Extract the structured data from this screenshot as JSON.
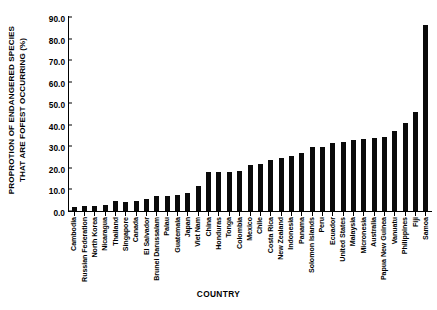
{
  "chart_data": {
    "type": "bar",
    "title": "",
    "xlabel": "COUNTRY",
    "ylabel": "PROPROTION OF ENDANGERED SPECIES THAT ARE FOFEST OCCURRING (%)",
    "ylabel_line1": "PROPROTION OF ENDANGERED SPECIES",
    "ylabel_line2": "THAT ARE FOFEST OCCURRING (%)",
    "ylim": [
      0.0,
      90.0
    ],
    "ytick_step": 10.0,
    "yticks": [
      "90.0",
      "80.0",
      "70.0",
      "60.0",
      "50.0",
      "40.0",
      "30.0",
      "20.0",
      "10.0",
      "0.0"
    ],
    "grid": false,
    "legend": null,
    "bar_color": "#0a0a0a",
    "categories": [
      "Cambodia",
      "Russian Federation",
      "North Korea",
      "Nicaragua",
      "Thailand",
      "Singapore",
      "Canada",
      "El Salvador",
      "Brunei Darussalam",
      "Palau",
      "Guatemala",
      "Japan",
      "Viet Nam",
      "China",
      "Honduras",
      "Tonga",
      "Colombia",
      "Mexico",
      "Chile",
      "Costa Rica",
      "New Zealand",
      "Indonesia",
      "Panama",
      "Solomon Islands",
      "Peru",
      "Ecuador",
      "United States",
      "Malaysia",
      "Micronesia",
      "Australia",
      "Papua New Guinea",
      "Vanuatu",
      "Philippines",
      "Fiji",
      "Samoa"
    ],
    "values": [
      2.0,
      2.2,
      2.5,
      3.0,
      4.5,
      4.3,
      4.5,
      5.7,
      7.0,
      7.1,
      7.3,
      8.3,
      11.8,
      18.0,
      18.0,
      18.0,
      18.7,
      21.5,
      22.0,
      23.5,
      24.5,
      25.5,
      27.0,
      29.5,
      29.5,
      31.5,
      32.0,
      33.0,
      33.5,
      34.0,
      34.5,
      37.0,
      41.0,
      46.0,
      86.5
    ]
  }
}
